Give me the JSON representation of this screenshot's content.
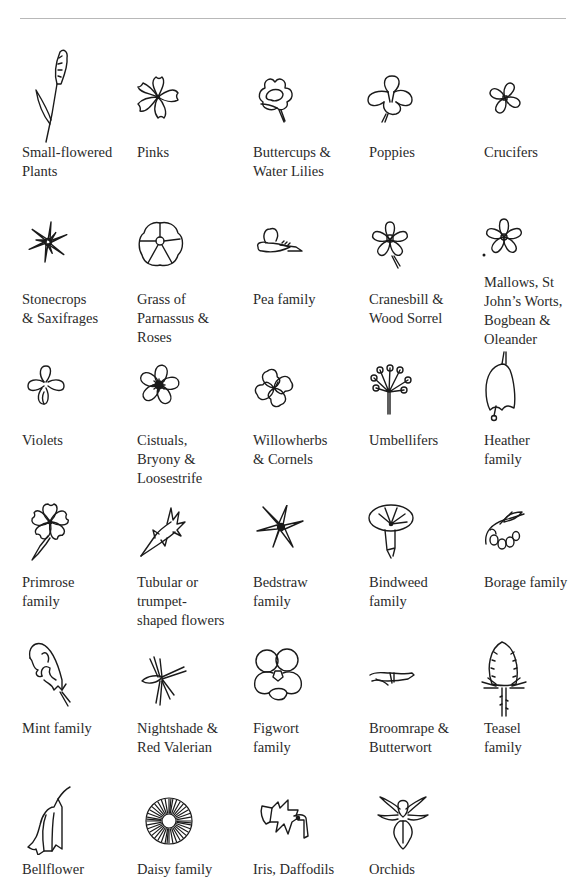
{
  "page": {
    "header_rule": true
  },
  "families": [
    {
      "label": "Small-flowered\nPlants",
      "icon": "small-flowered-spike-icon"
    },
    {
      "label": "Pinks",
      "icon": "pink-flower-icon"
    },
    {
      "label": "Buttercups &\nWater Lilies",
      "icon": "buttercup-icon"
    },
    {
      "label": "Poppies",
      "icon": "poppy-icon"
    },
    {
      "label": "Crucifers",
      "icon": "crucifer-icon"
    },
    {
      "label": "Stonecrops\n& Saxifrages",
      "icon": "stonecrop-star-icon"
    },
    {
      "label": "Grass of\nParnassus &\nRoses",
      "icon": "rose-icon"
    },
    {
      "label": "Pea family",
      "icon": "pea-flower-icon"
    },
    {
      "label": "Cranesbill &\nWood Sorrel",
      "icon": "cranesbill-icon"
    },
    {
      "label": "Mallows, St\nJohn’s Worts,\nBogbean &\nOleander",
      "icon": "mallow-icon"
    },
    {
      "label": "Violets",
      "icon": "violet-icon"
    },
    {
      "label": "Cistuals,\nBryony &\nLoosestrife",
      "icon": "cistus-icon"
    },
    {
      "label": "Willowherbs\n& Cornels",
      "icon": "willowherb-icon"
    },
    {
      "label": "Umbellifers",
      "icon": "umbel-icon"
    },
    {
      "label": "Heather\nfamily",
      "icon": "heather-bell-icon"
    },
    {
      "label": "Primrose\nfamily",
      "icon": "primrose-icon"
    },
    {
      "label": "Tubular or\ntrumpet-\nshaped flowers",
      "icon": "tubular-flower-icon"
    },
    {
      "label": "Bedstraw\nfamily",
      "icon": "bedstraw-star-icon"
    },
    {
      "label": "Bindweed\nfamily",
      "icon": "bindweed-trumpet-icon"
    },
    {
      "label": "Borage family",
      "icon": "borage-icon"
    },
    {
      "label": "Mint family",
      "icon": "mint-lipped-icon"
    },
    {
      "label": "Nightshade &\nRed Valerian",
      "icon": "nightshade-icon"
    },
    {
      "label": "Figwort\nfamily",
      "icon": "figwort-icon"
    },
    {
      "label": "Broomrape &\nButterwort",
      "icon": "broomrape-icon"
    },
    {
      "label": "Teasel\nfamily",
      "icon": "teasel-icon"
    },
    {
      "label": "Bellflower",
      "icon": "bellflower-icon"
    },
    {
      "label": "Daisy family",
      "icon": "daisy-icon"
    },
    {
      "label": "Iris, Daffodils",
      "icon": "iris-daffodil-icon"
    },
    {
      "label": "Orchids",
      "icon": "orchid-icon"
    }
  ]
}
